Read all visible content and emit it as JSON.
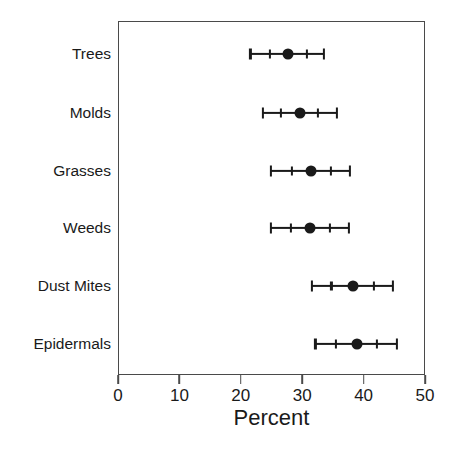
{
  "chart_data": {
    "type": "scatter",
    "subtype": "dot-plot-with-error-bars",
    "title": "",
    "xlabel": "Percent",
    "ylabel": "",
    "xlim": [
      0,
      50
    ],
    "xticks": [
      0,
      10,
      20,
      30,
      40,
      50
    ],
    "xticklabels": [
      "0",
      "10",
      "20",
      "30",
      "40",
      "50"
    ],
    "grid": false,
    "legend": null,
    "categories": [
      "Trees",
      "Molds",
      "Grasses",
      "Weeds",
      "Dust Mites",
      "Epidermals"
    ],
    "values": [
      27.6,
      29.4,
      31.2,
      31.1,
      38.1,
      38.7
    ],
    "ci_low": [
      21.4,
      23.5,
      24.8,
      24.7,
      31.4,
      32.0
    ],
    "ci_high": [
      33.4,
      35.5,
      37.6,
      37.5,
      44.6,
      45.3
    ],
    "inner_low": [
      24.6,
      26.4,
      28.1,
      28.0,
      34.6,
      35.3
    ],
    "inner_high": [
      30.6,
      32.4,
      34.5,
      34.4,
      41.5,
      42.0
    ],
    "series": [
      {
        "name": "Percent",
        "points": [
          {
            "category": "Trees",
            "value": 27.6,
            "ci_low": 21.4,
            "ci_high": 33.4,
            "inner_low": 24.6,
            "inner_high": 30.6
          },
          {
            "category": "Molds",
            "value": 29.4,
            "ci_low": 23.5,
            "ci_high": 35.5,
            "inner_low": 26.4,
            "inner_high": 32.4
          },
          {
            "category": "Grasses",
            "value": 31.2,
            "ci_low": 24.8,
            "ci_high": 37.6,
            "inner_low": 28.1,
            "inner_high": 34.5
          },
          {
            "category": "Weeds",
            "value": 31.1,
            "ci_low": 24.7,
            "ci_high": 37.5,
            "inner_low": 28.0,
            "inner_high": 34.4
          },
          {
            "category": "Dust Mites",
            "value": 38.1,
            "ci_low": 31.4,
            "ci_high": 44.6,
            "inner_low": 34.6,
            "inner_high": 41.5
          },
          {
            "category": "Epidermals",
            "value": 38.7,
            "ci_low": 32.0,
            "ci_high": 45.3,
            "inner_low": 35.3,
            "inner_high": 42.0
          }
        ]
      }
    ],
    "colors": {
      "marker": "#1a1a1a",
      "line": "#1a1a1a",
      "frame": "#4a4a4a",
      "background": "#ffffff",
      "text": "#1a1a1a"
    }
  }
}
